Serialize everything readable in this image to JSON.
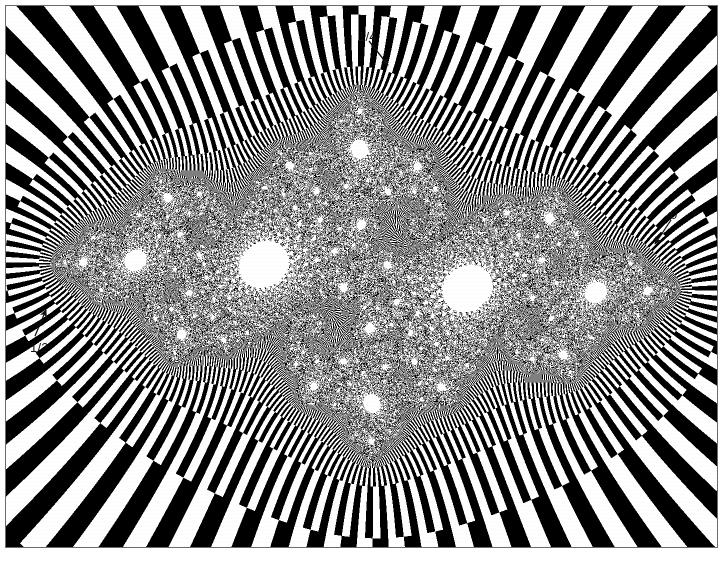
{
  "figure": {
    "kind": "julia-set-checkerboard-tiling",
    "background_color": "#ffffff",
    "ink_color": "#000000",
    "frame_color": "#6b6b6b",
    "width": 725,
    "height": 561
  },
  "plate": {
    "frame_left": 5,
    "frame_top": 5,
    "frame_width": 713,
    "frame_height": 543
  },
  "annotations": [
    {
      "id": "zero",
      "label": "0",
      "label_x": 670,
      "label_y": 208,
      "arrow_from_x": 668,
      "arrow_from_y": 222,
      "arrow_to_x": 653,
      "arrow_to_y": 246,
      "description": "arrow pointing down-left to the boundary on the right side"
    },
    {
      "id": "quarter",
      "label": "1/4",
      "label_x": 358,
      "label_y": 30,
      "arrow_from_x": 373,
      "arrow_from_y": 46,
      "arrow_to_x": 392,
      "arrow_to_y": 70,
      "description": "arrow pointing down-right to the boundary at the top"
    },
    {
      "id": "half",
      "label": "1/2",
      "label_x": 30,
      "label_y": 341,
      "arrow_from_x": 38,
      "arrow_from_y": 338,
      "arrow_to_x": 50,
      "arrow_to_y": 311,
      "description": "arrow pointing up-right to the boundary on the left side"
    }
  ],
  "chart_data": {
    "type": "fractal-set",
    "title": "",
    "set_name": "Julia set",
    "map": "quadratic",
    "c_real": -0.74543,
    "c_imag": 0.11301,
    "view_center_x": -0.02,
    "view_center_y": 0.0,
    "view_half_width": 1.72,
    "view_half_height": 1.29,
    "coloring": "checkerboard tiling of escape bands and angle sectors",
    "colors": [
      "#000000",
      "#ffffff"
    ],
    "max_iterations": 220,
    "escape_radius": 400,
    "marked_external_angles": [
      "0",
      "1/4",
      "1/2"
    ],
    "xlabel": "",
    "ylabel": "",
    "grid": false,
    "legend": false
  }
}
